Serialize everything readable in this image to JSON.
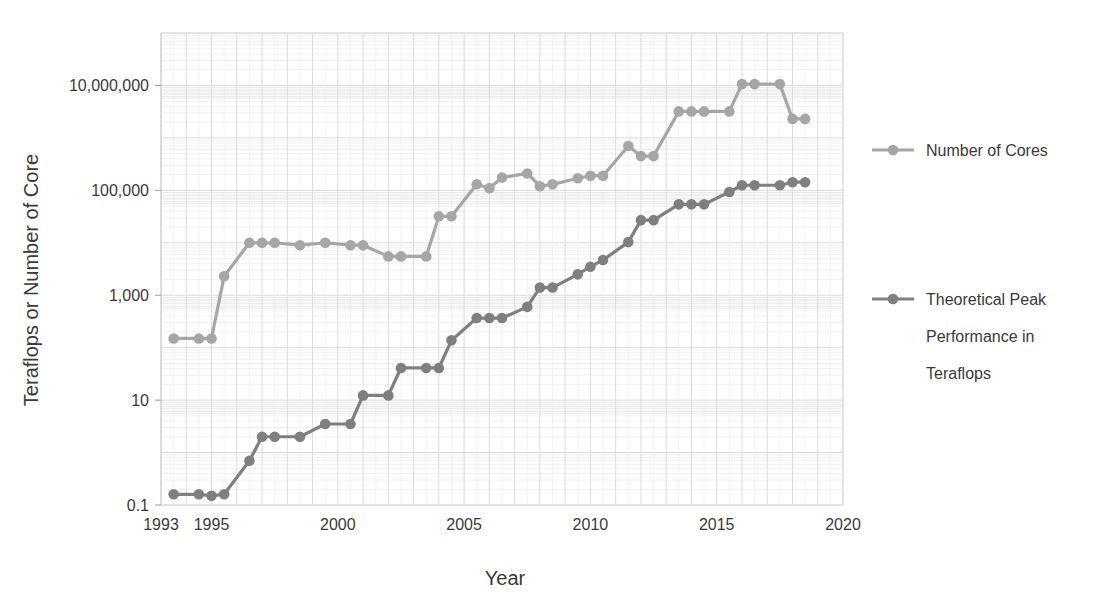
{
  "chart_data": {
    "type": "line",
    "title": "",
    "xlabel": "Year",
    "ylabel": "Teraflops or Number of Core",
    "xlim": [
      1993,
      2020
    ],
    "ylim": [
      0.1,
      100000000
    ],
    "yscale": "log",
    "grid": true,
    "legend_position": "right",
    "xticks": [
      1993,
      1995,
      2000,
      2005,
      2010,
      2015,
      2020
    ],
    "xtick_labels": [
      "1993",
      "1995",
      "2000",
      "2005",
      "2010",
      "2015",
      "2020"
    ],
    "yticks": [
      0.1,
      10,
      1000,
      100000,
      10000000
    ],
    "ytick_labels": [
      "0.1",
      "10",
      "1,000",
      "100,000",
      "10,000,000"
    ],
    "x": [
      1993.5,
      1994.5,
      1995.0,
      1995.5,
      1996.5,
      1997.0,
      1997.5,
      1998.5,
      1999.5,
      2000.5,
      2001.0,
      2002.0,
      2002.5,
      2003.5,
      2004.0,
      2004.5,
      2005.5,
      2006.0,
      2006.5,
      2007.5,
      2008.0,
      2008.5,
      2009.5,
      2010.0,
      2010.5,
      2011.5,
      2012.0,
      2012.5,
      2013.5,
      2014.0,
      2014.5,
      2015.5,
      2016.0,
      2016.5,
      2017.5,
      2018.0,
      2018.5
    ],
    "series": [
      {
        "name": "Number of Cores",
        "color": "#a6a6a6",
        "unit": "cores",
        "values": [
          150,
          150,
          150,
          2300,
          10000,
          10000,
          10000,
          9000,
          10000,
          9000,
          9000,
          5500,
          5500,
          5500,
          32000,
          32000,
          131000,
          110000,
          175000,
          210000,
          120000,
          130000,
          170000,
          190000,
          190000,
          700000,
          450000,
          450000,
          3200000,
          3200000,
          3200000,
          3200000,
          10600000,
          10600000,
          10600000,
          2300000,
          2300000
        ]
      },
      {
        "name": "Theoretical Peak Performance in Teraflops",
        "color": "#7f7f7f",
        "unit": "teraflops",
        "values": [
          0.16,
          0.16,
          0.15,
          0.16,
          0.7,
          2.0,
          2.0,
          2.0,
          3.5,
          3.5,
          12.3,
          12.3,
          41,
          41,
          41,
          138,
          367,
          367,
          367,
          600,
          1400,
          1400,
          2500,
          3500,
          4700,
          10300,
          27000,
          27000,
          54000,
          54000,
          54000,
          93000,
          125000,
          125000,
          125000,
          143000,
          143000
        ]
      }
    ],
    "legend": [
      {
        "label": "Number of Cores",
        "color": "#a6a6a6"
      },
      {
        "label": "Theoretical Peak Performance in Teraflops",
        "color": "#7f7f7f",
        "lines": [
          "Theoretical Peak",
          "Performance in",
          "Teraflops"
        ]
      }
    ]
  }
}
